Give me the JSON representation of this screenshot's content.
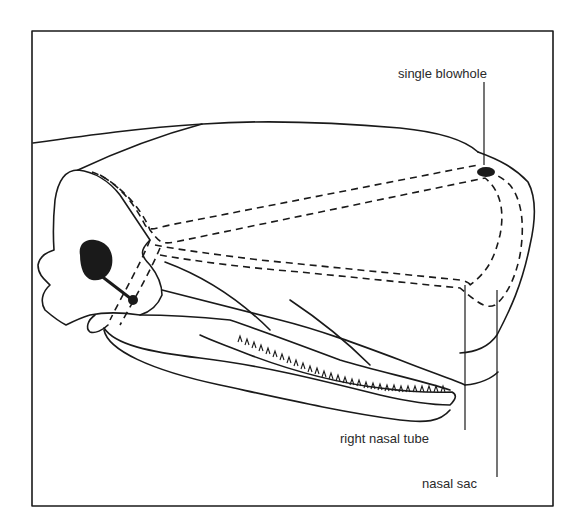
{
  "diagram": {
    "labels": {
      "blowhole": "single blowhole",
      "nasal_tube": "right nasal tube",
      "nasal_sac": "nasal sac"
    },
    "colors": {
      "stroke": "#1a1a1a",
      "background": "#ffffff"
    }
  }
}
